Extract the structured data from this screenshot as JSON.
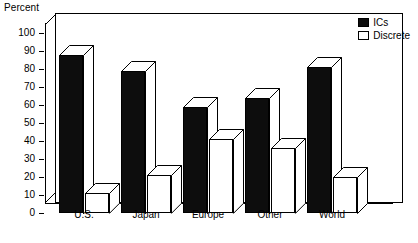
{
  "chart_data": {
    "type": "bar",
    "title": "",
    "ylabel": "Percent",
    "xlabel": "",
    "ylim": [
      0,
      100
    ],
    "ytick_step": 10,
    "yticks": [
      "100",
      "90",
      "80",
      "70",
      "60",
      "50",
      "40",
      "30",
      "20",
      "10",
      "0"
    ],
    "grid": false,
    "legend_position": "top-right",
    "style": "3d-extruded-column",
    "categories": [
      "U.S.",
      "Japan",
      "Europe",
      "Other",
      "World"
    ],
    "series": [
      {
        "name": "ICs",
        "color": "#0d0d0d",
        "values": [
          88,
          79,
          59,
          64,
          81
        ]
      },
      {
        "name": "Discrete",
        "color": "#ffffff",
        "values": [
          11,
          21,
          41,
          36,
          20
        ]
      }
    ]
  },
  "legend": {
    "items": [
      {
        "label": "ICs"
      },
      {
        "label": "Discrete"
      }
    ]
  }
}
